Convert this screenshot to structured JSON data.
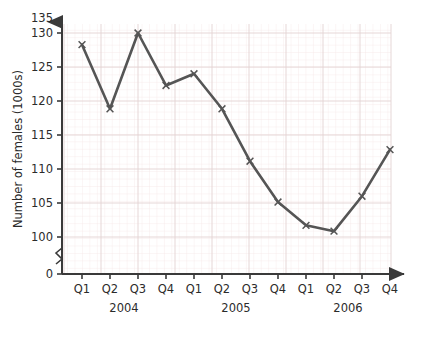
{
  "chart_data": {
    "type": "line",
    "title": "",
    "xlabel": "",
    "ylabel": "Number of  females (1000s)",
    "categories": [
      "Q1",
      "Q2",
      "Q3",
      "Q4",
      "Q1",
      "Q2",
      "Q3",
      "Q4",
      "Q1",
      "Q2",
      "Q3",
      "Q4"
    ],
    "values": [
      133,
      122,
      135,
      126,
      128,
      122,
      113,
      106,
      102,
      101,
      107,
      115
    ],
    "series": [
      {
        "name": "Number of females (1000s)",
        "values": [
          133,
          122,
          135,
          126,
          128,
          122,
          113,
          106,
          102,
          101,
          107,
          115
        ]
      }
    ],
    "group_labels": [
      "2004",
      "2005",
      "2006"
    ],
    "ytick_labels": [
      "0",
      "100",
      "105",
      "110",
      "115",
      "120",
      "125",
      "130",
      "135"
    ],
    "ytick_values": [
      0,
      100,
      105,
      110,
      115,
      120,
      125,
      130,
      135
    ],
    "ylim": [
      100,
      135
    ],
    "axis_break": true,
    "axis_break_label": "0",
    "grid": true,
    "legend": "none",
    "marker": "x",
    "line_color": "#555555",
    "grid_color_minor": "#f0dede",
    "grid_color_major": "#dcd2d2",
    "axis_color": "#3a3a3a"
  },
  "axis": {
    "y_title": "Number of  females (1000s)"
  }
}
